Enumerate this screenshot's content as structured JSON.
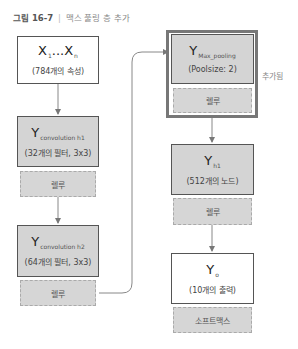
{
  "title": {
    "figure_number": "그림 16-7",
    "separator": "|",
    "caption": "맥스 풀링 층 추가"
  },
  "left_column": {
    "input": {
      "symbol": "X",
      "subscript_first": "1",
      "ellipsis": "...",
      "symbol_last": "X",
      "subscript_last": "n",
      "description": "(784개의 속성)"
    },
    "conv1": {
      "symbol": "Y",
      "subscript": "convolution h1",
      "description": "(32개의 필터, 3x3)",
      "activation": "렐루"
    },
    "conv2": {
      "symbol": "Y",
      "subscript": "convolution h2",
      "description": "(64개의 필터, 3x3)",
      "activation": "렐루"
    }
  },
  "right_column": {
    "maxpool": {
      "symbol": "Y",
      "subscript": "Max_pooling",
      "description": "(Poolsize: 2)",
      "activation": "렐루",
      "note": "추가됨"
    },
    "hidden": {
      "symbol": "Y",
      "subscript": "h1",
      "description": "(512개의 노드)",
      "activation": "렐루"
    },
    "output": {
      "symbol": "Y",
      "subscript": "o",
      "description": "(10개의 출력)",
      "activation": "소프트맥스"
    }
  },
  "colors": {
    "box_gray": "#d4d4d4",
    "box_border": "#555555",
    "highlight_frame": "#777777",
    "arrow": "#777777"
  }
}
